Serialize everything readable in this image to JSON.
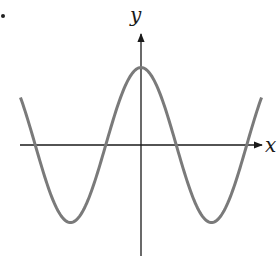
{
  "chart_data": {
    "type": "line",
    "title": "",
    "xlabel": "x",
    "ylabel": "y",
    "grid": false,
    "legend": null,
    "ticks": {
      "x": [],
      "y": []
    },
    "series": [
      {
        "name": "curve",
        "color": "#7a7a7a",
        "x": [
          -1.71,
          -1.5,
          -1.0,
          -0.5,
          0.0,
          0.5,
          1.0,
          1.5,
          1.71
        ],
        "y": [
          0.62,
          0.0,
          -1.0,
          0.0,
          1.0,
          0.0,
          -1.0,
          0.0,
          0.62
        ]
      }
    ],
    "xlim": [
      -1.73,
      1.73
    ],
    "ylim": [
      -1.45,
      1.7
    ]
  },
  "labels": {
    "x_axis": "x",
    "y_axis": "y"
  },
  "colors": {
    "curve": "#7a7a7a",
    "axes": "#1a1a1a"
  }
}
